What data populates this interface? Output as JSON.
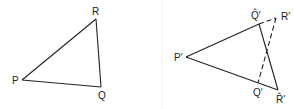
{
  "figure": {
    "left_panel": {
      "name": "original-triangle",
      "vertices": [
        {
          "id": "P",
          "label": "P",
          "x": 22,
          "y": 80,
          "lx": 12,
          "ly": 84
        },
        {
          "id": "R",
          "label": "R",
          "x": 96,
          "y": 19,
          "lx": 92,
          "ly": 15
        },
        {
          "id": "Q",
          "label": "Q",
          "x": 101,
          "y": 87,
          "lx": 98,
          "ly": 99
        }
      ],
      "edges": [
        [
          "P",
          "R",
          "solid"
        ],
        [
          "R",
          "Q",
          "solid"
        ],
        [
          "Q",
          "P",
          "solid"
        ]
      ]
    },
    "right_panel": {
      "name": "transformed-triangle",
      "vertices": [
        {
          "id": "P1",
          "label": "P′",
          "x": 186,
          "y": 57,
          "lx": 174,
          "ly": 61
        },
        {
          "id": "Qh",
          "label": "Q̂′",
          "x": 259,
          "y": 24,
          "lx": 251,
          "ly": 19
        },
        {
          "id": "R1",
          "label": "R′",
          "x": 276,
          "y": 18,
          "lx": 281,
          "ly": 20
        },
        {
          "id": "Q1",
          "label": "Q′",
          "x": 258,
          "y": 83,
          "lx": 253,
          "ly": 96
        },
        {
          "id": "Rh",
          "label": "R̂′",
          "x": 278,
          "y": 90,
          "lx": 276,
          "ly": 103
        }
      ],
      "edges": [
        [
          "P1",
          "Qh",
          "solid"
        ],
        [
          "P1",
          "Rh",
          "solid"
        ],
        [
          "Qh",
          "Rh",
          "solid"
        ],
        [
          "Qh",
          "R1",
          "dashed"
        ],
        [
          "R1",
          "Q1",
          "dashed"
        ]
      ]
    },
    "separator_x": 162
  }
}
